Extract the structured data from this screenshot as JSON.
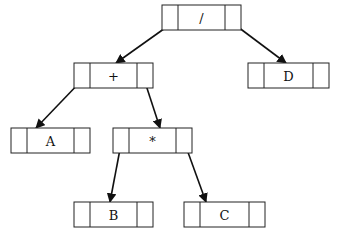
{
  "diagram": {
    "type": "binary-expression-tree",
    "nodes": [
      {
        "id": "div",
        "label": "/",
        "x": 162,
        "y": 5,
        "w": 79,
        "h": 25
      },
      {
        "id": "plus",
        "label": "+",
        "x": 74,
        "y": 63,
        "w": 79,
        "h": 25
      },
      {
        "id": "D",
        "label": "D",
        "x": 248,
        "y": 63,
        "w": 81,
        "h": 25
      },
      {
        "id": "A",
        "label": "A",
        "x": 11,
        "y": 128,
        "w": 79,
        "h": 25
      },
      {
        "id": "mul",
        "label": "*",
        "x": 113,
        "y": 128,
        "w": 79,
        "h": 25
      },
      {
        "id": "B",
        "label": "B",
        "x": 74,
        "y": 202,
        "w": 79,
        "h": 25
      },
      {
        "id": "C",
        "label": "C",
        "x": 184,
        "y": 202,
        "w": 81,
        "h": 25
      }
    ],
    "edges": [
      {
        "from": "div",
        "to": "plus",
        "x1": 175,
        "y1": 21,
        "x2": 116,
        "y2": 63
      },
      {
        "from": "div",
        "to": "D",
        "x1": 230,
        "y1": 21,
        "x2": 286,
        "y2": 63
      },
      {
        "from": "plus",
        "to": "A",
        "x1": 83,
        "y1": 79,
        "x2": 36,
        "y2": 128
      },
      {
        "from": "plus",
        "to": "mul",
        "x1": 144,
        "y1": 79,
        "x2": 160,
        "y2": 128
      },
      {
        "from": "mul",
        "to": "B",
        "x1": 121,
        "y1": 144,
        "x2": 110,
        "y2": 202
      },
      {
        "from": "mul",
        "to": "C",
        "x1": 185,
        "y1": 144,
        "x2": 206,
        "y2": 202
      }
    ]
  }
}
